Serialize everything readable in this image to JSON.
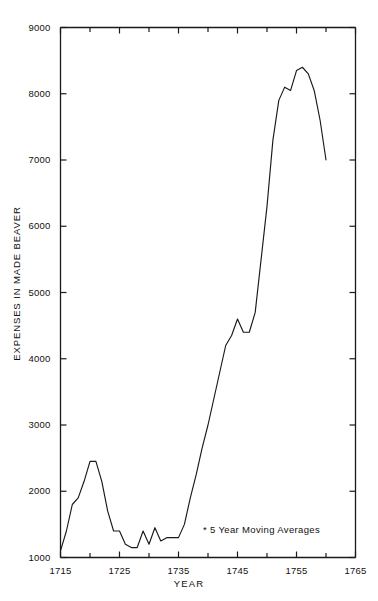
{
  "chart_data": {
    "type": "line",
    "title": "",
    "subtitle": "",
    "xlabel": "YEAR",
    "ylabel": "EXPENSES IN MADE BEAVER",
    "xlim": [
      1715,
      1765
    ],
    "ylim": [
      1000,
      9000
    ],
    "grid": false,
    "legend": null,
    "annotations": [
      {
        "text": "* 5 Year Moving Averages",
        "x": 1741,
        "y": 1600
      }
    ],
    "x_major_ticks": [
      1715,
      1725,
      1735,
      1745,
      1755,
      1765
    ],
    "x_minor_ticks": [
      1720,
      1730,
      1740,
      1750,
      1760
    ],
    "x_tick_labels": [
      "1715",
      "1725",
      "1735",
      "1745",
      "1755",
      "1765"
    ],
    "y_ticks": [
      1000,
      2000,
      3000,
      4000,
      5000,
      6000,
      7000,
      8000,
      9000
    ],
    "y_tick_labels": [
      "1000",
      "2000",
      "3000",
      "4000",
      "5000",
      "6000",
      "7000",
      "8000",
      "9000"
    ],
    "series": [
      {
        "name": "Expenses in Made Beaver (5 year moving average)",
        "color": "#1a1a1a",
        "x": [
          1715,
          1716,
          1717,
          1718,
          1719,
          1720,
          1721,
          1722,
          1723,
          1724,
          1725,
          1726,
          1727,
          1728,
          1729,
          1730,
          1731,
          1732,
          1733,
          1734,
          1735,
          1736,
          1737,
          1738,
          1739,
          1740,
          1741,
          1742,
          1743,
          1744,
          1745,
          1746,
          1747,
          1748,
          1749,
          1750,
          1751,
          1752,
          1753,
          1754,
          1755,
          1756,
          1757,
          1758,
          1759,
          1760
        ],
        "y": [
          1100,
          1400,
          1800,
          1900,
          2150,
          2450,
          2450,
          2150,
          1700,
          1400,
          1400,
          1200,
          1150,
          1150,
          1400,
          1200,
          1450,
          1250,
          1300,
          1300,
          1300,
          1500,
          1900,
          2250,
          2650,
          3000,
          3400,
          3800,
          4200,
          4350,
          4600,
          4400,
          4400,
          4700,
          5500,
          6300,
          7300,
          7900,
          8100,
          8050,
          8350,
          8400,
          8300,
          8050,
          7600,
          7000
        ]
      }
    ]
  },
  "axis": {
    "line_color": "#1a1a1a"
  }
}
